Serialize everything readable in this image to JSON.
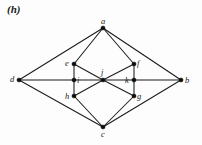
{
  "figure": {
    "label": "(h)",
    "caption_style": "bold-italic",
    "type": "undirected-graph-diagram",
    "background_color": "#fdfdfd",
    "ink_color": "#1b1b1b"
  },
  "graph": {
    "vertex_count": 11,
    "edge_count": 20,
    "vertices": [
      {
        "id": "a",
        "label": "a",
        "x": 103,
        "y": 28,
        "label_dx": -2,
        "label_dy": -11
      },
      {
        "id": "b",
        "label": "b",
        "x": 181,
        "y": 80,
        "label_dx": 4,
        "label_dy": -4
      },
      {
        "id": "c",
        "label": "c",
        "x": 103,
        "y": 127,
        "label_dx": -2,
        "label_dy": 3
      },
      {
        "id": "d",
        "label": "d",
        "x": 19,
        "y": 80,
        "label_dx": -9,
        "label_dy": -5
      },
      {
        "id": "e",
        "label": "e",
        "x": 74,
        "y": 64,
        "label_dx": -9,
        "label_dy": -5
      },
      {
        "id": "f",
        "label": "f",
        "x": 134,
        "y": 64,
        "label_dx": 3,
        "label_dy": -5
      },
      {
        "id": "g",
        "label": "g",
        "x": 134,
        "y": 96,
        "label_dx": 3,
        "label_dy": -4
      },
      {
        "id": "h",
        "label": "h",
        "x": 74,
        "y": 96,
        "label_dx": -9,
        "label_dy": -4
      },
      {
        "id": "i",
        "label": "i",
        "x": 74,
        "y": 80,
        "label_dx": 3,
        "label_dy": -4
      },
      {
        "id": "j",
        "label": "j",
        "x": 103,
        "y": 80,
        "label_dx": -2,
        "label_dy": -12
      },
      {
        "id": "k",
        "label": "k",
        "x": 134,
        "y": 80,
        "label_dx": -9,
        "label_dy": -4
      }
    ],
    "edges": [
      {
        "from": "a",
        "to": "d"
      },
      {
        "from": "a",
        "to": "e"
      },
      {
        "from": "a",
        "to": "f"
      },
      {
        "from": "a",
        "to": "b"
      },
      {
        "from": "c",
        "to": "d"
      },
      {
        "from": "c",
        "to": "h"
      },
      {
        "from": "c",
        "to": "g"
      },
      {
        "from": "c",
        "to": "b"
      },
      {
        "from": "d",
        "to": "i"
      },
      {
        "from": "b",
        "to": "k"
      },
      {
        "from": "e",
        "to": "i"
      },
      {
        "from": "i",
        "to": "h"
      },
      {
        "from": "f",
        "to": "k"
      },
      {
        "from": "k",
        "to": "g"
      },
      {
        "from": "e",
        "to": "j"
      },
      {
        "from": "i",
        "to": "j"
      },
      {
        "from": "h",
        "to": "j"
      },
      {
        "from": "j",
        "to": "f"
      },
      {
        "from": "j",
        "to": "k"
      },
      {
        "from": "j",
        "to": "g"
      }
    ]
  }
}
